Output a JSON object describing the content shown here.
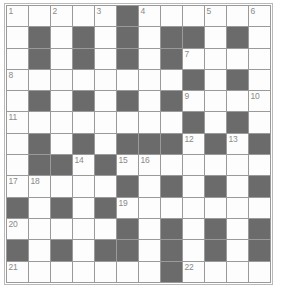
{
  "puzzle": {
    "title": "Crossword Grid",
    "type": "crossword",
    "columns": 12,
    "rows": 13,
    "colors": {
      "block": "#6b6b6b",
      "white": "#fdfdfd",
      "grid_line": "#9a9a9a",
      "outer_border": "#b9b9b9",
      "number_text": "#8a8a8a"
    },
    "legend": {
      "white_cell": "white-cell",
      "block_cell": "block-cell"
    },
    "grid": [
      [
        {
          "type": "white",
          "num": "1"
        },
        {
          "type": "white",
          "num": ""
        },
        {
          "type": "white",
          "num": "2"
        },
        {
          "type": "white",
          "num": ""
        },
        {
          "type": "white",
          "num": "3"
        },
        {
          "type": "block",
          "num": ""
        },
        {
          "type": "white",
          "num": "4"
        },
        {
          "type": "white",
          "num": ""
        },
        {
          "type": "white",
          "num": ""
        },
        {
          "type": "white",
          "num": "5"
        },
        {
          "type": "white",
          "num": ""
        },
        {
          "type": "white",
          "num": "6"
        }
      ],
      [
        {
          "type": "white",
          "num": ""
        },
        {
          "type": "block",
          "num": ""
        },
        {
          "type": "white",
          "num": ""
        },
        {
          "type": "block",
          "num": ""
        },
        {
          "type": "white",
          "num": ""
        },
        {
          "type": "block",
          "num": ""
        },
        {
          "type": "white",
          "num": ""
        },
        {
          "type": "block",
          "num": ""
        },
        {
          "type": "block",
          "num": ""
        },
        {
          "type": "white",
          "num": ""
        },
        {
          "type": "block",
          "num": ""
        },
        {
          "type": "white",
          "num": ""
        }
      ],
      [
        {
          "type": "white",
          "num": ""
        },
        {
          "type": "block",
          "num": ""
        },
        {
          "type": "white",
          "num": ""
        },
        {
          "type": "block",
          "num": ""
        },
        {
          "type": "white",
          "num": ""
        },
        {
          "type": "block",
          "num": ""
        },
        {
          "type": "white",
          "num": ""
        },
        {
          "type": "block",
          "num": ""
        },
        {
          "type": "white",
          "num": "7"
        },
        {
          "type": "white",
          "num": ""
        },
        {
          "type": "white",
          "num": ""
        },
        {
          "type": "white",
          "num": ""
        }
      ],
      [
        {
          "type": "white",
          "num": "8"
        },
        {
          "type": "white",
          "num": ""
        },
        {
          "type": "white",
          "num": ""
        },
        {
          "type": "white",
          "num": ""
        },
        {
          "type": "white",
          "num": ""
        },
        {
          "type": "white",
          "num": ""
        },
        {
          "type": "white",
          "num": ""
        },
        {
          "type": "white",
          "num": ""
        },
        {
          "type": "block",
          "num": ""
        },
        {
          "type": "white",
          "num": ""
        },
        {
          "type": "block",
          "num": ""
        },
        {
          "type": "white",
          "num": ""
        }
      ],
      [
        {
          "type": "white",
          "num": ""
        },
        {
          "type": "block",
          "num": ""
        },
        {
          "type": "white",
          "num": ""
        },
        {
          "type": "block",
          "num": ""
        },
        {
          "type": "white",
          "num": ""
        },
        {
          "type": "block",
          "num": ""
        },
        {
          "type": "white",
          "num": ""
        },
        {
          "type": "block",
          "num": ""
        },
        {
          "type": "white",
          "num": "9"
        },
        {
          "type": "white",
          "num": ""
        },
        {
          "type": "white",
          "num": ""
        },
        {
          "type": "white",
          "num": "10"
        }
      ],
      [
        {
          "type": "white",
          "num": "11"
        },
        {
          "type": "white",
          "num": ""
        },
        {
          "type": "white",
          "num": ""
        },
        {
          "type": "white",
          "num": ""
        },
        {
          "type": "white",
          "num": ""
        },
        {
          "type": "white",
          "num": ""
        },
        {
          "type": "white",
          "num": ""
        },
        {
          "type": "white",
          "num": ""
        },
        {
          "type": "block",
          "num": ""
        },
        {
          "type": "white",
          "num": ""
        },
        {
          "type": "block",
          "num": ""
        },
        {
          "type": "white",
          "num": ""
        }
      ],
      [
        {
          "type": "white",
          "num": ""
        },
        {
          "type": "block",
          "num": ""
        },
        {
          "type": "white",
          "num": ""
        },
        {
          "type": "block",
          "num": ""
        },
        {
          "type": "white",
          "num": ""
        },
        {
          "type": "block",
          "num": ""
        },
        {
          "type": "block",
          "num": ""
        },
        {
          "type": "block",
          "num": ""
        },
        {
          "type": "white",
          "num": "12"
        },
        {
          "type": "block",
          "num": ""
        },
        {
          "type": "white",
          "num": "13"
        },
        {
          "type": "block",
          "num": ""
        }
      ],
      [
        {
          "type": "white",
          "num": ""
        },
        {
          "type": "block",
          "num": ""
        },
        {
          "type": "block",
          "num": ""
        },
        {
          "type": "white",
          "num": "14"
        },
        {
          "type": "block",
          "num": ""
        },
        {
          "type": "white",
          "num": "15"
        },
        {
          "type": "white",
          "num": "16"
        },
        {
          "type": "white",
          "num": ""
        },
        {
          "type": "white",
          "num": ""
        },
        {
          "type": "white",
          "num": ""
        },
        {
          "type": "white",
          "num": ""
        },
        {
          "type": "white",
          "num": ""
        }
      ],
      [
        {
          "type": "white",
          "num": "17"
        },
        {
          "type": "white",
          "num": "18"
        },
        {
          "type": "white",
          "num": ""
        },
        {
          "type": "white",
          "num": ""
        },
        {
          "type": "white",
          "num": ""
        },
        {
          "type": "block",
          "num": ""
        },
        {
          "type": "white",
          "num": ""
        },
        {
          "type": "block",
          "num": ""
        },
        {
          "type": "white",
          "num": ""
        },
        {
          "type": "block",
          "num": ""
        },
        {
          "type": "white",
          "num": ""
        },
        {
          "type": "block",
          "num": ""
        }
      ],
      [
        {
          "type": "block",
          "num": ""
        },
        {
          "type": "white",
          "num": ""
        },
        {
          "type": "block",
          "num": ""
        },
        {
          "type": "white",
          "num": ""
        },
        {
          "type": "block",
          "num": ""
        },
        {
          "type": "white",
          "num": "19"
        },
        {
          "type": "white",
          "num": ""
        },
        {
          "type": "white",
          "num": ""
        },
        {
          "type": "white",
          "num": ""
        },
        {
          "type": "white",
          "num": ""
        },
        {
          "type": "white",
          "num": ""
        },
        {
          "type": "white",
          "num": ""
        }
      ],
      [
        {
          "type": "white",
          "num": "20"
        },
        {
          "type": "white",
          "num": ""
        },
        {
          "type": "white",
          "num": ""
        },
        {
          "type": "white",
          "num": ""
        },
        {
          "type": "white",
          "num": ""
        },
        {
          "type": "block",
          "num": ""
        },
        {
          "type": "white",
          "num": ""
        },
        {
          "type": "block",
          "num": ""
        },
        {
          "type": "white",
          "num": ""
        },
        {
          "type": "block",
          "num": ""
        },
        {
          "type": "white",
          "num": ""
        },
        {
          "type": "block",
          "num": ""
        }
      ],
      [
        {
          "type": "block",
          "num": ""
        },
        {
          "type": "white",
          "num": ""
        },
        {
          "type": "block",
          "num": ""
        },
        {
          "type": "white",
          "num": ""
        },
        {
          "type": "block",
          "num": ""
        },
        {
          "type": "block",
          "num": ""
        },
        {
          "type": "white",
          "num": ""
        },
        {
          "type": "block",
          "num": ""
        },
        {
          "type": "white",
          "num": ""
        },
        {
          "type": "block",
          "num": ""
        },
        {
          "type": "white",
          "num": ""
        },
        {
          "type": "block",
          "num": ""
        }
      ],
      [
        {
          "type": "white",
          "num": "21"
        },
        {
          "type": "white",
          "num": ""
        },
        {
          "type": "white",
          "num": ""
        },
        {
          "type": "white",
          "num": ""
        },
        {
          "type": "white",
          "num": ""
        },
        {
          "type": "white",
          "num": ""
        },
        {
          "type": "white",
          "num": ""
        },
        {
          "type": "block",
          "num": ""
        },
        {
          "type": "white",
          "num": "22"
        },
        {
          "type": "white",
          "num": ""
        },
        {
          "type": "white",
          "num": ""
        },
        {
          "type": "white",
          "num": ""
        }
      ]
    ],
    "clue_numbers": [
      "1",
      "2",
      "3",
      "4",
      "5",
      "6",
      "7",
      "8",
      "9",
      "10",
      "11",
      "12",
      "13",
      "14",
      "15",
      "16",
      "17",
      "18",
      "19",
      "20",
      "21",
      "22"
    ]
  }
}
